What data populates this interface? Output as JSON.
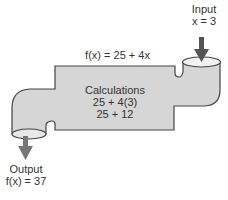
{
  "diagram": {
    "function_label": "f(x) = 25 + 4x",
    "input": {
      "title": "Input",
      "value": "x = 3"
    },
    "calculations": {
      "title": "Calculations",
      "line1": "25 + 4(3)",
      "line2": "25 + 12"
    },
    "output": {
      "title": "Output",
      "value": "f(x) = 37"
    },
    "colors": {
      "body": "#d4d4d4",
      "outline": "#444444",
      "arrow": "#555555"
    }
  }
}
